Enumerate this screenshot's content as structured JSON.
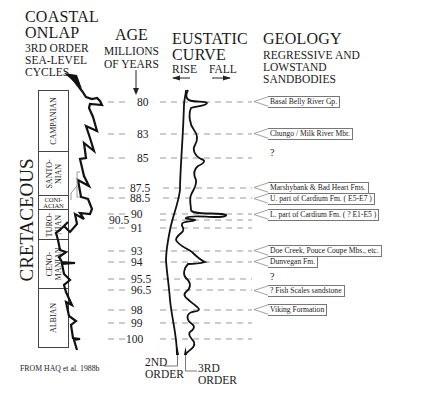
{
  "headers": {
    "coastal_onlap": {
      "title_line1": "COASTAL",
      "title_line2": "ONLAP",
      "sub_line1": "3RD ORDER",
      "sub_line2": "SEA-LEVEL",
      "sub_line3": "CYCLES"
    },
    "age": {
      "title": "AGE",
      "sub_line1": "MILLIONS",
      "sub_line2": "OF YEARS"
    },
    "eustatic": {
      "title_line1": "EUSTATIC",
      "title_line2": "CURVE",
      "rise": "RISE",
      "fall": "FALL"
    },
    "geology": {
      "title": "GEOLOGY",
      "sub_line1": "REGRESSIVE  AND",
      "sub_line2": "LOWSTAND",
      "sub_line3": "SANDBODIES"
    }
  },
  "period": "CRETACEOUS",
  "stages": [
    {
      "name": "CAMPANIAN",
      "line1": "CAMPANIAN",
      "line2": ""
    },
    {
      "name": "SANTONIAN",
      "line1": "SANTO-",
      "line2": "NIAN"
    },
    {
      "name": "CONIACIAN",
      "line1": "CONI-",
      "line2": "ACIAN"
    },
    {
      "name": "TURONIAN",
      "line1": "TURO-",
      "line2": "NIAN"
    },
    {
      "name": "CENOMANIAN",
      "line1": "CENO-",
      "line2": "MANIAN"
    },
    {
      "name": "ALBIAN",
      "line1": "ALBIAN",
      "line2": ""
    }
  ],
  "ages": [
    "80",
    "83",
    "85",
    "87.5",
    "88.5",
    "90",
    "90.5",
    "91",
    "93",
    "94",
    "95.5",
    "96.5",
    "98",
    "99",
    "100"
  ],
  "sandbodies": [
    {
      "label": "Basal  Belly  River  Gp.",
      "age": "80"
    },
    {
      "label": "Chungo / Milk  River  Mbr.",
      "age": "83"
    },
    {
      "label": "Marshybank  &  Bad  Heart  Fms.",
      "age": "87.5"
    },
    {
      "label": "U.  part  of  Cardium  Fm.  ( E5-E7 )",
      "age": "88.5"
    },
    {
      "label": "L.  part  of  Cardium  Fm.  ( ? E1-E5 )",
      "age": "90"
    },
    {
      "label": "Doe  Creek,  Pouce  Coupe  Mbs.,  etc.",
      "age": "93"
    },
    {
      "label": "Dunvegan  Fm.",
      "age": "94"
    },
    {
      "label": "?  Fish  Scales  sandstone",
      "age": "96.5"
    },
    {
      "label": "Viking  Formation",
      "age": "98"
    }
  ],
  "question_marks": [
    "?",
    "?"
  ],
  "legend": {
    "second_order": [
      "2ND",
      "ORDER"
    ],
    "third_order": [
      "3RD",
      "ORDER"
    ]
  },
  "source": "FROM  HAQ  et  al.  1988b"
}
